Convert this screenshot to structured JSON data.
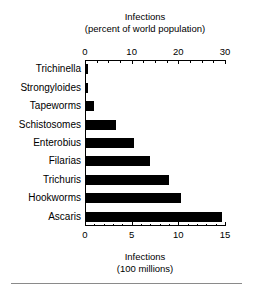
{
  "chart_data": {
    "type": "bar",
    "orientation": "horizontal",
    "title": "",
    "categories": [
      "Trichinella",
      "Strongyloides",
      "Tapeworms",
      "Schistosomes",
      "Enterobius",
      "Filarias",
      "Trichuris",
      "Hookworms",
      "Ascaris"
    ],
    "values": [
      0.3,
      0.35,
      1.0,
      3.3,
      5.2,
      7.0,
      9.0,
      10.3,
      14.7
    ],
    "values_percent_world_population": [
      0.6,
      0.7,
      2.0,
      6.6,
      10.4,
      14.0,
      18.0,
      20.6,
      29.4
    ],
    "bar_color": "#000000",
    "grid": false,
    "legend": false,
    "top_axis": {
      "title_line1": "Infections",
      "title_line2": "(percent of world population)",
      "ticks": [
        0,
        10,
        20,
        30
      ],
      "tick_labels": [
        "0",
        "10",
        "20",
        "30"
      ],
      "minor_tick_step": 2.5,
      "range": [
        0,
        30
      ]
    },
    "bottom_axis": {
      "title_line1": "Infections",
      "title_line2": "(100 millions)",
      "ticks": [
        0,
        5,
        10,
        15
      ],
      "tick_labels": [
        "0",
        "5",
        "10",
        "15"
      ],
      "minor_tick_step": 1,
      "range": [
        0,
        15
      ]
    },
    "ylabel": "",
    "xlabel": "Infections (100 millions)"
  },
  "top_axis_title": {
    "line1": "Infections",
    "line2": "(percent of world population)"
  },
  "bottom_axis_title": {
    "line1": "Infections",
    "line2": "(100 millions)"
  },
  "top_ticks": [
    "0",
    "10",
    "20",
    "30"
  ],
  "bottom_ticks": [
    "0",
    "5",
    "10",
    "15"
  ],
  "categories": [
    "Trichinella",
    "Strongyloides",
    "Tapeworms",
    "Schistosomes",
    "Enterobius",
    "Filarias",
    "Trichuris",
    "Hookworms",
    "Ascaris"
  ]
}
